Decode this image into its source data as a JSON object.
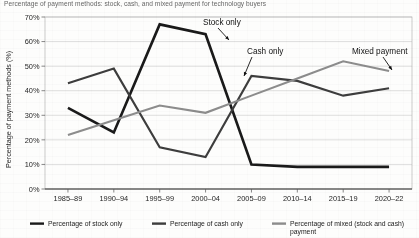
{
  "chart_data": {
    "type": "line",
    "title": "Percentage of payment methods: stock, cash, and mixed payment for technology buyers",
    "xlabel": "",
    "ylabel": "Percentage of payment methods (%)",
    "categories": [
      "1985–89",
      "1990–94",
      "1995–99",
      "2000–04",
      "2005–09",
      "2010–14",
      "2015–19",
      "2020–22"
    ],
    "ylim": [
      0,
      70
    ],
    "ytick_labels": [
      "0%",
      "10%",
      "20%",
      "30%",
      "40%",
      "50%",
      "60%",
      "70%"
    ],
    "ytick_values": [
      0,
      10,
      20,
      30,
      40,
      50,
      60,
      70
    ],
    "grid": true,
    "legend_position": "bottom",
    "series": [
      {
        "name": "Percentage of stock only",
        "color": "#1a1a1a",
        "stroke_width": 2.6,
        "values": [
          33,
          23,
          67,
          63,
          10,
          9,
          9,
          9
        ]
      },
      {
        "name": "Percentage of cash only",
        "color": "#3d3d3d",
        "stroke_width": 2.1,
        "values": [
          43,
          49,
          17,
          13,
          46,
          44,
          38,
          41
        ]
      },
      {
        "name": "Percentage of mixed (stock and cash) payment",
        "color": "#8c8c8c",
        "stroke_width": 2.1,
        "values": [
          22,
          28,
          34,
          31,
          38,
          45,
          52,
          48
        ]
      }
    ],
    "annotations": [
      {
        "text": "Stock only",
        "series": "Percentage of stock only"
      },
      {
        "text": "Cash only",
        "series": "Percentage of cash only"
      },
      {
        "text": "Mixed payment",
        "series": "Percentage of mixed (stock and cash) payment"
      }
    ]
  },
  "legend": {
    "items": [
      {
        "label": "Percentage of stock only",
        "color": "#1a1a1a"
      },
      {
        "label": "Percentage of cash only",
        "color": "#3d3d3d"
      },
      {
        "label": "Percentage of mixed (stock and cash)",
        "color": "#8c8c8c"
      },
      {
        "label": "payment",
        "color": "#8c8c8c"
      }
    ]
  }
}
